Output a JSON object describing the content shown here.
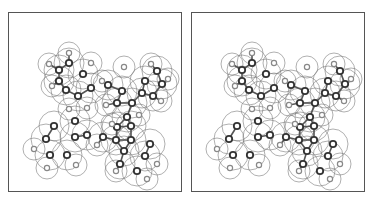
{
  "figure": {
    "panels": [
      {
        "id": "left",
        "x": 8
      },
      {
        "id": "right",
        "x": 191
      }
    ],
    "colors": {
      "frame": "#555555",
      "sphere": "#7a7a7a",
      "bond": "#555555",
      "heavy_atom": "#333333",
      "light_atom": "#888888"
    },
    "molecule": {
      "heavy_atoms": [
        [
          50,
          57
        ],
        [
          50,
          68
        ],
        [
          60,
          50
        ],
        [
          74,
          61
        ],
        [
          82,
          75
        ],
        [
          69,
          83
        ],
        [
          57,
          77
        ],
        [
          99,
          72
        ],
        [
          113,
          78
        ],
        [
          108,
          90
        ],
        [
          123,
          90
        ],
        [
          133,
          80
        ],
        [
          136,
          68
        ],
        [
          148,
          58
        ],
        [
          153,
          71
        ],
        [
          144,
          83
        ],
        [
          118,
          104
        ],
        [
          122,
          113
        ],
        [
          108,
          114
        ],
        [
          94,
          124
        ],
        [
          78,
          122
        ],
        [
          66,
          108
        ],
        [
          45,
          113
        ],
        [
          37,
          126
        ],
        [
          41,
          142
        ],
        [
          58,
          142
        ],
        [
          66,
          124
        ],
        [
          107,
          127
        ],
        [
          115,
          138
        ],
        [
          122,
          127
        ],
        [
          141,
          131
        ],
        [
          136,
          143
        ],
        [
          128,
          158
        ],
        [
          111,
          151
        ]
      ],
      "light_atoms": [
        [
          60,
          40
        ],
        [
          40,
          51
        ],
        [
          82,
          50
        ],
        [
          43,
          73
        ],
        [
          78,
          95
        ],
        [
          60,
          96
        ],
        [
          97,
          92
        ],
        [
          93,
          68
        ],
        [
          115,
          54
        ],
        [
          142,
          51
        ],
        [
          159,
          66
        ],
        [
          152,
          88
        ],
        [
          25,
          136
        ],
        [
          38,
          155
        ],
        [
          67,
          152
        ],
        [
          88,
          132
        ],
        [
          103,
          111
        ],
        [
          130,
          102
        ],
        [
          148,
          151
        ],
        [
          138,
          166
        ],
        [
          107,
          158
        ]
      ]
    }
  }
}
